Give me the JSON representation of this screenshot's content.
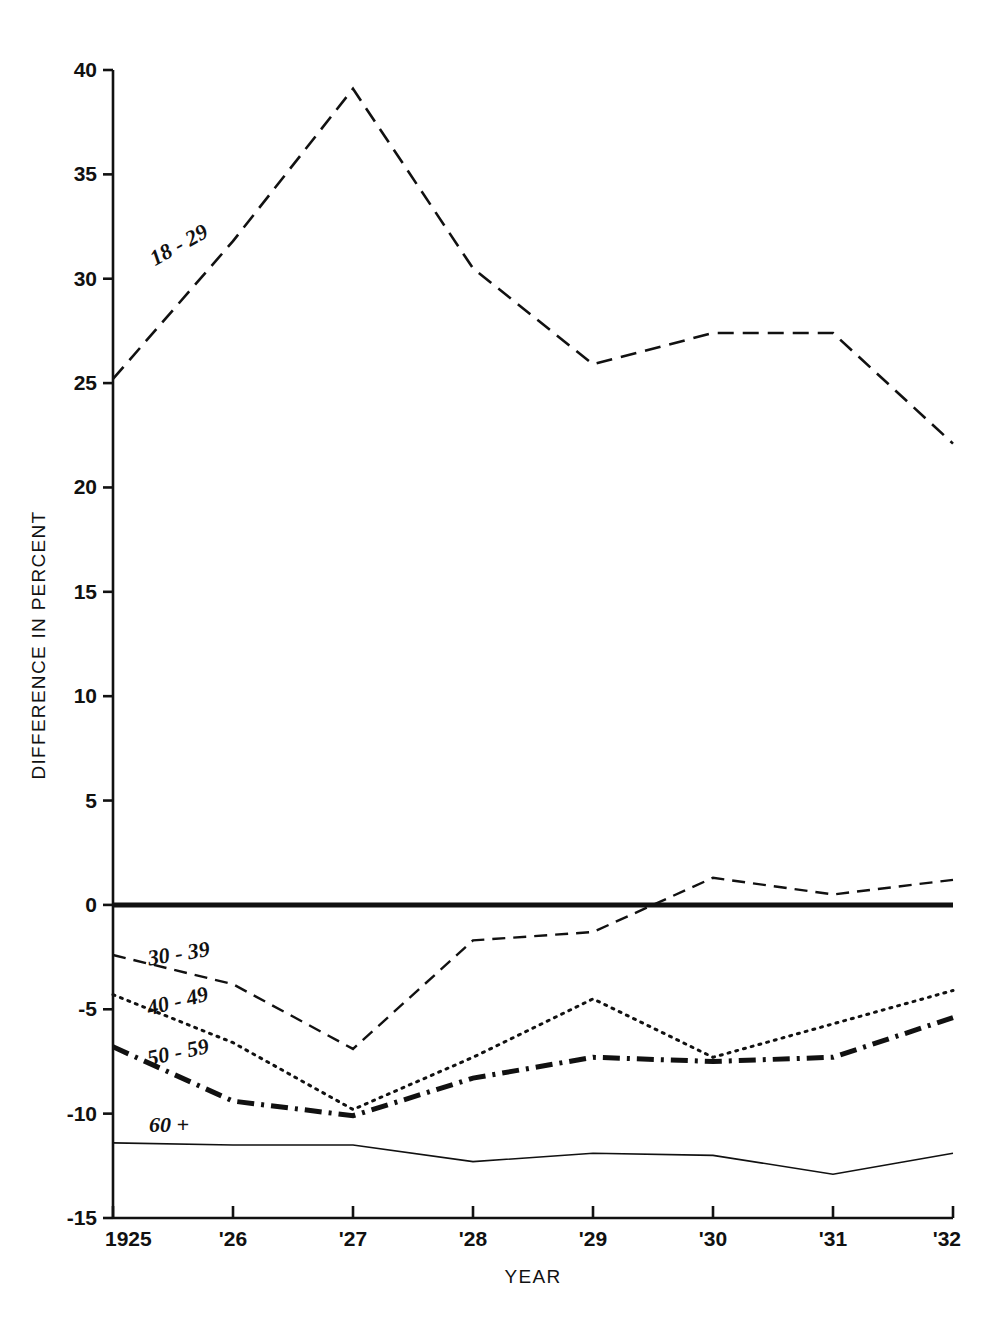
{
  "chart_data": {
    "type": "line",
    "title": "",
    "xlabel": "YEAR",
    "ylabel": "DIFFERENCE IN PERCENT",
    "x": [
      1925,
      1926,
      1927,
      1928,
      1929,
      1930,
      1931,
      1932
    ],
    "xtick_labels": [
      "1925",
      "'26",
      "'27",
      "'28",
      "'29",
      "'30",
      "'31",
      "'32"
    ],
    "ytick_labels": [
      "40",
      "35",
      "30",
      "25",
      "20",
      "15",
      "10",
      "5",
      "0",
      "-5",
      "-10",
      "-15"
    ],
    "ytick_values": [
      40,
      35,
      30,
      25,
      20,
      15,
      10,
      5,
      0,
      -5,
      -10,
      -15
    ],
    "xlim": [
      1925,
      1932
    ],
    "ylim": [
      -15,
      40
    ],
    "grid": false,
    "legend": "inline-series-labels",
    "zero_reference_line": 0,
    "series": [
      {
        "name": "18-29",
        "label": "18 - 29",
        "style": "long-dash",
        "dasharray": "16,9",
        "width": 2.6,
        "color": "#111111",
        "values": [
          25.2,
          31.8,
          39.1,
          30.5,
          25.9,
          27.4,
          27.4,
          22.1
        ],
        "label_x": 1925.35,
        "label_y": 30.6,
        "label_rotate": -29
      },
      {
        "name": "30-39",
        "label": "30 - 39",
        "style": "dash",
        "dasharray": "13,8",
        "width": 2.4,
        "color": "#111111",
        "values": [
          -2.4,
          -3.8,
          -6.9,
          -1.7,
          -1.3,
          1.3,
          0.5,
          1.2
        ],
        "label_x": 1925.3,
        "label_y": -2.9,
        "label_rotate": -9
      },
      {
        "name": "40-49",
        "label": "40 - 49",
        "style": "dotted",
        "dasharray": "2,6",
        "width": 3.0,
        "color": "#111111",
        "values": [
          -4.3,
          -6.6,
          -9.8,
          -7.3,
          -4.5,
          -7.3,
          -5.7,
          -4.1
        ],
        "label_x": 1925.3,
        "label_y": -5.3,
        "label_rotate": -14
      },
      {
        "name": "50-59",
        "label": "50 - 59",
        "style": "dash-dot",
        "dasharray": "17,7,3,7",
        "width": 5.0,
        "color": "#111111",
        "values": [
          -6.8,
          -9.4,
          -10.1,
          -8.3,
          -7.3,
          -7.5,
          -7.3,
          -5.4
        ],
        "label_x": 1925.3,
        "label_y": -7.7,
        "label_rotate": -12
      },
      {
        "name": "60+",
        "label": "60 +",
        "style": "solid",
        "dasharray": "none",
        "width": 1.6,
        "color": "#111111",
        "values": [
          -11.4,
          -11.5,
          -11.5,
          -12.3,
          -11.9,
          -12.0,
          -12.9,
          -11.9
        ],
        "label_x": 1925.3,
        "label_y": -10.9,
        "label_rotate": 0
      }
    ]
  }
}
